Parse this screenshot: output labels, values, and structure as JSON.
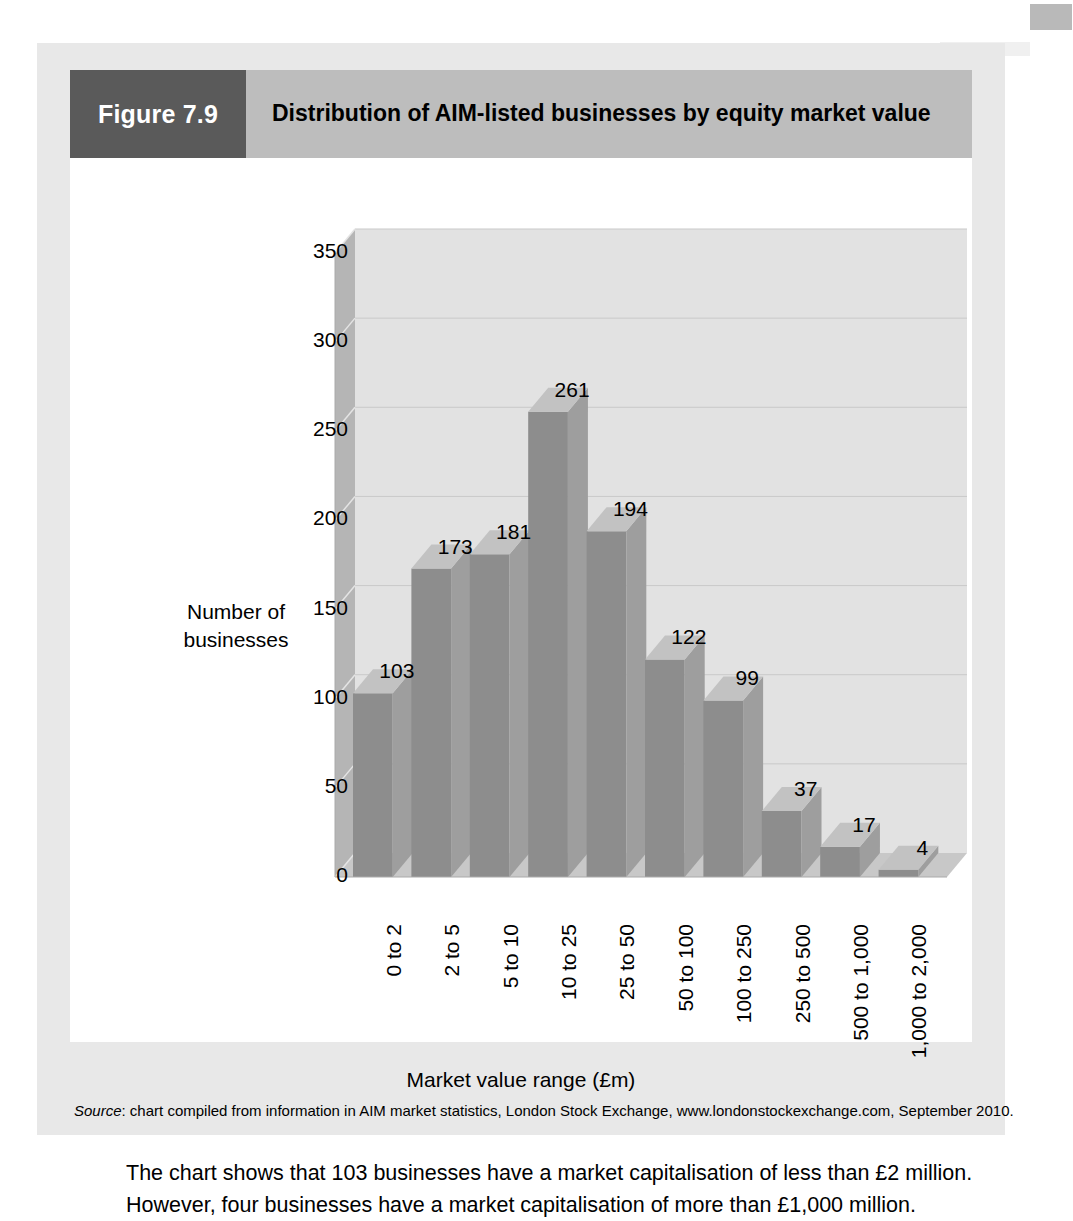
{
  "figure": {
    "number_label": "Figure 7.9",
    "title": "Distribution of AIM-listed businesses by equity market value",
    "caption": "The chart shows that 103 businesses have a market capitalisation of less than £2 million. However, four businesses have a market capitalisation of more than £1,000 million.",
    "source_prefix": "Source",
    "source_text": ": chart compiled from information in AIM market statistics, London Stock Exchange, www.londonstockexchange.com, September 2010."
  },
  "colors": {
    "header_band": "#bdbdbd",
    "figure_number_box": "#5a5a5a",
    "panel_background": "#e8e8e8",
    "canvas": "#ffffff",
    "bar_front": "#8d8d8d",
    "bar_side": "#9e9e9e",
    "bar_top": "#c2c2c2",
    "wall_back": "#e2e2e2",
    "wall_side": "#b5b5b5",
    "floor": "#c8c8c8",
    "gridline": "#c9c9c9"
  },
  "chart_data": {
    "type": "bar",
    "title": "Distribution of AIM-listed businesses by equity market value",
    "xlabel": "Market value range (£m)",
    "ylabel": "Number of businesses",
    "categories": [
      "0 to 2",
      "2 to 5",
      "5 to 10",
      "10 to 25",
      "25 to 50",
      "50 to 100",
      "100 to 250",
      "250 to 500",
      "500 to 1,000",
      "1,000 to 2,000"
    ],
    "values": [
      103,
      173,
      181,
      261,
      194,
      122,
      99,
      37,
      17,
      4
    ],
    "value_labels": [
      "103",
      "173",
      "181",
      "261",
      "194",
      "122",
      "99",
      "37",
      "17",
      "4"
    ],
    "ylim": [
      0,
      350
    ],
    "yticks": [
      0,
      50,
      100,
      150,
      200,
      250,
      300,
      350
    ],
    "ytick_labels": [
      "0",
      "50",
      "100",
      "150",
      "200",
      "250",
      "300",
      "350"
    ],
    "grid": true,
    "legend": "none",
    "style": "3d-column"
  }
}
